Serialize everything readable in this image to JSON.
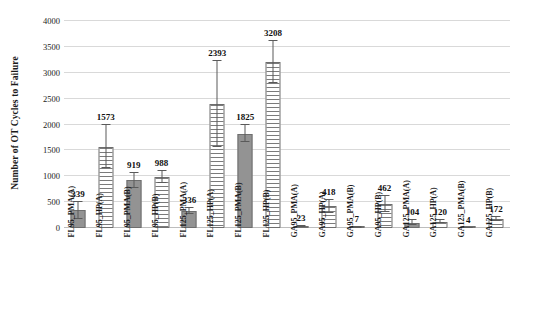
{
  "chart_data": {
    "type": "bar",
    "title": "",
    "xlabel": "",
    "ylabel": "Number of OT Cycles to Failure",
    "ylim": [
      0,
      4000
    ],
    "yticks": [
      0,
      500,
      1000,
      1500,
      2000,
      2500,
      3000,
      3500,
      4000
    ],
    "grid": true,
    "legend": "none",
    "categories": [
      "FL95_PMA(A)",
      "FL95_HP(A)",
      "FL95_PMA(B)",
      "FL95_HP(B)",
      "FL125_PMA(A)",
      "FL125_HP(A)",
      "FL125_PMA(B)",
      "FL125_HP(B)",
      "GA95_PMA(A)",
      "GA95_HP(A)",
      "GA95_PMA(B)",
      "GA95_HP(B)",
      "GA125_PMA(A)",
      "GA125_HP(A)",
      "GA125_PMA(B)",
      "GA125_HP(B)"
    ],
    "values": [
      339,
      1573,
      919,
      988,
      336,
      2393,
      1825,
      3208,
      23,
      418,
      7,
      462,
      104,
      120,
      4,
      172
    ],
    "data_labels": [
      "339",
      "1573",
      "919",
      "988",
      "336",
      "2393",
      "1825",
      "3208",
      "23",
      "418",
      "7",
      "462",
      "104",
      "120",
      "4",
      "172"
    ],
    "error_upper": [
      160,
      420,
      140,
      110,
      60,
      830,
      170,
      400,
      8,
      130,
      4,
      160,
      55,
      30,
      3,
      40
    ],
    "error_lower": [
      160,
      420,
      140,
      110,
      60,
      830,
      170,
      400,
      8,
      130,
      4,
      160,
      55,
      30,
      3,
      40
    ],
    "fills": [
      "solid",
      "hatch",
      "solid",
      "hatch",
      "solid",
      "hatch",
      "solid",
      "hatch",
      "solid",
      "hatch",
      "solid",
      "hatch",
      "solid",
      "hatch",
      "solid",
      "hatch"
    ],
    "colors": {
      "bar_solid": "#939393",
      "bar_hatch": "#7b7b7b",
      "bar_border": "#6e6e6e",
      "error_bar": "#5a5a5a",
      "gridline": "#d9d9d9",
      "text": "#1a1a1a",
      "background": "#ffffff"
    }
  }
}
